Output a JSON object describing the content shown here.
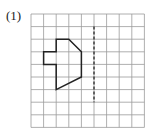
{
  "problem": {
    "label": "(1)"
  },
  "grid": {
    "cols": 9,
    "rows": 9,
    "x0": 31,
    "y0": 14,
    "cell": 12.6,
    "line_color": "#9a9a9a"
  },
  "axis_of_symmetry": {
    "style": "dashed",
    "col": 5,
    "from_row": 1,
    "to_row": 7,
    "color": "#333333"
  },
  "shape": {
    "color": "#222222",
    "vertices_grid": [
      [
        2,
        2
      ],
      [
        3,
        2
      ],
      [
        4,
        3
      ],
      [
        4,
        5
      ],
      [
        2,
        6
      ],
      [
        2,
        4
      ],
      [
        1,
        4
      ],
      [
        1,
        3
      ],
      [
        2,
        3
      ]
    ]
  }
}
